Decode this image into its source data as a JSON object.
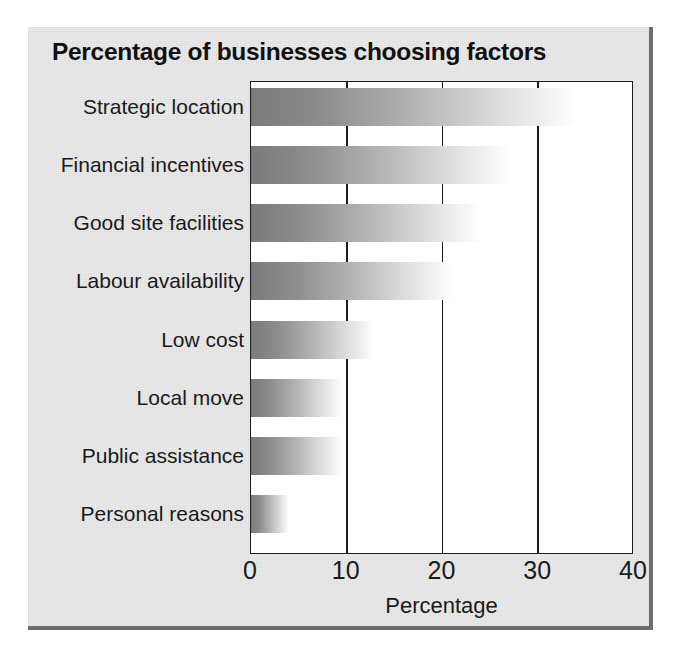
{
  "chart_data": {
    "type": "bar",
    "orientation": "horizontal",
    "title": "Percentage of businesses choosing factors",
    "xlabel": "Percentage",
    "ylabel": "",
    "xlim": [
      0,
      40
    ],
    "xticks": [
      "0",
      "10",
      "20",
      "30",
      "40"
    ],
    "xtick_values": [
      0,
      10,
      20,
      30,
      40
    ],
    "grid": true,
    "grid_axis": "x",
    "legend": false,
    "categories": [
      "Strategic location",
      "Financial incentives",
      "Good site facilities",
      "Labour availability",
      "Low cost",
      "Local move",
      "Public assistance",
      "Personal reasons"
    ],
    "values": [
      34,
      27,
      24,
      21,
      13,
      9.5,
      9.5,
      4
    ],
    "series": [
      {
        "name": "Percentage of businesses",
        "values": [
          34,
          27,
          24,
          21,
          13,
          9.5,
          9.5,
          4
        ]
      }
    ]
  },
  "style": {
    "card_background": "#ebebeb",
    "plot_background": "#ffffff",
    "axis_color": "#1b1b1b",
    "text_color": "#1a1a1a",
    "bar_dark": "#7a7a7a",
    "bar_light": "#ffffff"
  }
}
